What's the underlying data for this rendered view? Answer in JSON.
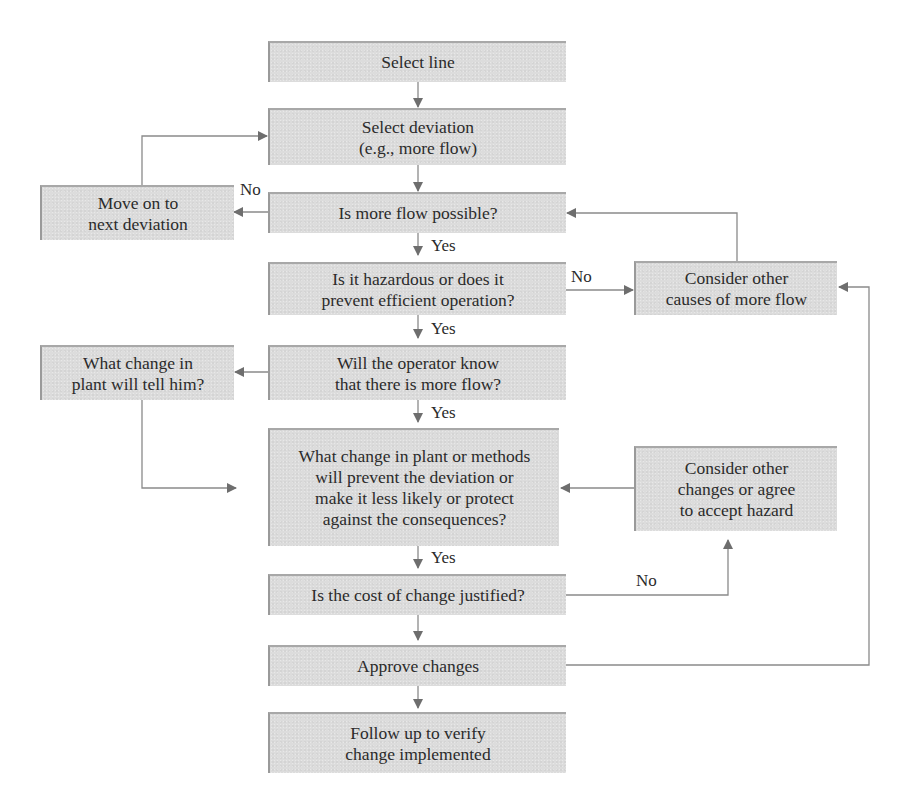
{
  "diagram": {
    "type": "flowchart",
    "colors": {
      "box_fill": "#dcdcdc",
      "box_border": "#9a9a9a",
      "connector": "#8a8a8a",
      "arrowhead": "#6e6e6e",
      "text": "#2b2b2b"
    },
    "nodes": {
      "select_line": "Select line",
      "select_deviation": "Select deviation\n(e.g., more flow)",
      "more_flow_possible": "Is more flow possible?",
      "move_on": "Move on to\nnext deviation",
      "is_hazardous": "Is it hazardous or does it\nprevent efficient operation?",
      "consider_other_causes": "Consider other\ncauses of more flow",
      "operator_know": "Will the operator know\nthat there is more flow?",
      "what_change_tell": "What change in\nplant will tell him?",
      "what_change_prevent": "What change in plant or methods\nwill prevent the deviation or\nmake it less likely or protect\nagainst the consequences?",
      "consider_other_changes": "Consider other\nchanges or agree\nto accept hazard",
      "cost_justified": "Is the cost of change justified?",
      "approve_changes": "Approve changes",
      "follow_up": "Follow up to verify\nchange implemented"
    },
    "edge_labels": {
      "no_move_on": "No",
      "yes_possible": "Yes",
      "no_hazard": "No",
      "yes_hazard": "Yes",
      "yes_operator": "Yes",
      "yes_prevent": "Yes",
      "no_cost": "No"
    },
    "edges": [
      {
        "from": "select_line",
        "to": "select_deviation",
        "label": ""
      },
      {
        "from": "select_deviation",
        "to": "more_flow_possible",
        "label": ""
      },
      {
        "from": "more_flow_possible",
        "to": "move_on",
        "label": "No"
      },
      {
        "from": "move_on",
        "to": "select_deviation",
        "label": ""
      },
      {
        "from": "more_flow_possible",
        "to": "is_hazardous",
        "label": "Yes"
      },
      {
        "from": "is_hazardous",
        "to": "consider_other_causes",
        "label": "No"
      },
      {
        "from": "consider_other_causes",
        "to": "more_flow_possible",
        "label": ""
      },
      {
        "from": "is_hazardous",
        "to": "operator_know",
        "label": "Yes"
      },
      {
        "from": "operator_know",
        "to": "what_change_tell",
        "label": ""
      },
      {
        "from": "what_change_tell",
        "to": "what_change_prevent",
        "label": ""
      },
      {
        "from": "operator_know",
        "to": "what_change_prevent",
        "label": "Yes"
      },
      {
        "from": "consider_other_changes",
        "to": "what_change_prevent",
        "label": ""
      },
      {
        "from": "what_change_prevent",
        "to": "cost_justified",
        "label": "Yes"
      },
      {
        "from": "cost_justified",
        "to": "consider_other_changes",
        "label": "No"
      },
      {
        "from": "cost_justified",
        "to": "approve_changes",
        "label": ""
      },
      {
        "from": "approve_changes",
        "to": "consider_other_causes",
        "label": ""
      },
      {
        "from": "approve_changes",
        "to": "follow_up",
        "label": ""
      }
    ]
  }
}
